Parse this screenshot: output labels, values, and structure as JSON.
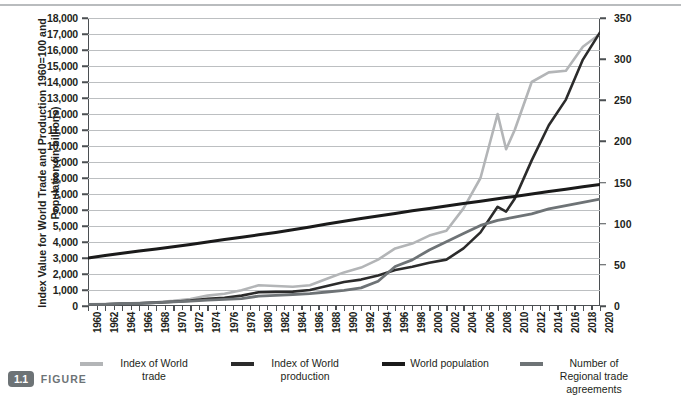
{
  "caption": {
    "number": "1.1",
    "word": "FIGURE"
  },
  "axes": {
    "left_title": "Index Value for World Trade and Production 1960=100 and Population (in billions)",
    "right_title": "Number of Regional Trade Agreements",
    "left_ticks": [
      "0",
      "1,000",
      "2,000",
      "3,000",
      "4,000",
      "5,000",
      "6,000",
      "7,000",
      "8,000",
      "9,000",
      "10,000",
      "11,000",
      "12,000",
      "13,000",
      "14,000",
      "15,000",
      "16,000",
      "17,000",
      "18,000"
    ],
    "right_ticks": [
      "0",
      "50",
      "100",
      "150",
      "200",
      "250",
      "300",
      "350"
    ],
    "x_ticks": [
      "1960",
      "1962",
      "1964",
      "1966",
      "1968",
      "1970",
      "1972",
      "1974",
      "1976",
      "1978",
      "1980",
      "1982",
      "1984",
      "1986",
      "1988",
      "1990",
      "1992",
      "1994",
      "1996",
      "1998",
      "2000",
      "2002",
      "2004",
      "2006",
      "2008",
      "2010",
      "2012",
      "2014",
      "2016",
      "2018",
      "2020"
    ]
  },
  "legend": [
    {
      "label": "Index of World trade",
      "color": "#b3b5b7"
    },
    {
      "label": "Index of World production",
      "color": "#2b2b2b"
    },
    {
      "label": "World population",
      "color": "#1a1a1a"
    },
    {
      "label": "Number of Regional trade agreements",
      "color": "#6e7376"
    }
  ],
  "chart_data": {
    "type": "line",
    "title": "",
    "xlabel": "",
    "ylabel": "Index Value for World Trade and Production 1960=100 and Population (in billions)",
    "y2label": "Number of Regional Trade Agreements",
    "ylim": [
      0,
      18000
    ],
    "y2lim": [
      0,
      350
    ],
    "xlim": [
      1960,
      2020
    ],
    "grid": true,
    "legend_position": "bottom",
    "x": [
      1960,
      1962,
      1964,
      1966,
      1968,
      1970,
      1972,
      1974,
      1976,
      1978,
      1980,
      1982,
      1984,
      1986,
      1988,
      1990,
      1992,
      1994,
      1996,
      1998,
      2000,
      2002,
      2004,
      2006,
      2008,
      2009,
      2010,
      2012,
      2014,
      2016,
      2018,
      2020
    ],
    "series": [
      {
        "name": "Index of World trade",
        "axis": "left",
        "color": "#b3b5b7",
        "values": [
          100,
          120,
          150,
          190,
          240,
          320,
          430,
          650,
          760,
          980,
          1300,
          1250,
          1200,
          1300,
          1700,
          2100,
          2400,
          2900,
          3600,
          3900,
          4400,
          4700,
          6100,
          8000,
          12000,
          9800,
          11000,
          14000,
          14600,
          14700,
          16200,
          17000
        ]
      },
      {
        "name": "Index of World production",
        "axis": "left",
        "color": "#2b2b2b",
        "values": [
          100,
          115,
          140,
          170,
          210,
          270,
          340,
          450,
          520,
          650,
          860,
          880,
          900,
          1000,
          1250,
          1500,
          1650,
          1900,
          2250,
          2450,
          2700,
          2900,
          3600,
          4600,
          6200,
          5900,
          6700,
          9100,
          11300,
          12900,
          15400,
          17100
        ]
      },
      {
        "name": "World population",
        "axis": "left",
        "color": "#1a1a1a",
        "values": [
          3000,
          3150,
          3300,
          3430,
          3570,
          3700,
          3850,
          4000,
          4150,
          4300,
          4450,
          4600,
          4770,
          4940,
          5120,
          5300,
          5460,
          5620,
          5790,
          5950,
          6100,
          6250,
          6400,
          6550,
          6700,
          6780,
          6850,
          7000,
          7150,
          7300,
          7450,
          7600
        ]
      },
      {
        "name": "Number of Regional trade agreements",
        "axis": "right",
        "color": "#6e7376",
        "values": [
          2,
          2,
          3,
          3,
          4,
          5,
          6,
          7,
          8,
          9,
          12,
          13,
          14,
          15,
          17,
          19,
          22,
          30,
          48,
          56,
          68,
          78,
          88,
          98,
          104,
          106,
          108,
          112,
          118,
          122,
          126,
          130
        ]
      }
    ]
  }
}
